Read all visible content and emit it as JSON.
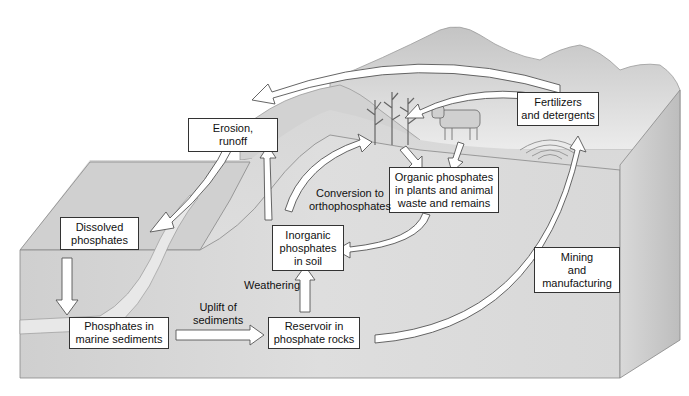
{
  "diagram": {
    "boxes": {
      "erosion": {
        "lines": [
          "Erosion,",
          "runoff"
        ]
      },
      "dissolved": {
        "lines": [
          "Dissolved",
          "phosphates"
        ]
      },
      "marine": {
        "lines": [
          "Phosphates in",
          "marine sediments"
        ]
      },
      "reservoir": {
        "lines": [
          "Reservoir in",
          "phosphate rocks"
        ]
      },
      "inorganic": {
        "lines": [
          "Inorganic",
          "phosphates",
          "in soil"
        ]
      },
      "organic": {
        "lines": [
          "Organic phosphates",
          "in plants and animal",
          "waste and remains"
        ]
      },
      "fertilizers": {
        "lines": [
          "Fertilizers",
          "and detergents"
        ]
      },
      "mining": {
        "lines": [
          "Mining",
          "and",
          "manufacturing"
        ]
      }
    },
    "labels": {
      "uplift": {
        "lines": [
          "Uplift of",
          "sediments"
        ]
      },
      "weathering": {
        "lines": [
          "Weathering"
        ]
      },
      "conversion": {
        "lines": [
          "Conversion to",
          "orthophosphates"
        ]
      }
    },
    "colors": {
      "box_fill": "#ffffff",
      "box_border": "#333333",
      "terrain_light": "#e6e6e6",
      "terrain_mid": "#cfcfcf",
      "terrain_dark": "#b5b5b5",
      "arrow_fill": "#ffffff",
      "arrow_stroke": "#555555"
    }
  }
}
